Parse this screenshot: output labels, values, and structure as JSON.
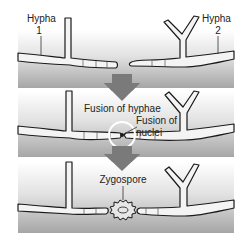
{
  "diagram": {
    "stages": [
      {
        "id": "stage-1",
        "labels": {
          "hypha_left": "Hypha",
          "hypha_left_num": "1",
          "hypha_right": "Hypha",
          "hypha_right_num": "2"
        }
      },
      {
        "id": "stage-2",
        "labels": {
          "fusion_hyphae": "Fusion of hyphae",
          "fusion_nuclei_line1": "Fusion of",
          "fusion_nuclei_line2": "nuclei"
        }
      },
      {
        "id": "stage-3",
        "labels": {
          "zygospore": "Zygospore"
        }
      }
    ],
    "arrows": [
      "down-arrow",
      "down-arrow"
    ],
    "colors": {
      "panel_top": "#ffffff",
      "panel_bottom": "#a8a8a8",
      "arrow": "#7a7a7a",
      "hypha_fill": "#f4f4f4",
      "outline": "#1a1a1a"
    }
  }
}
